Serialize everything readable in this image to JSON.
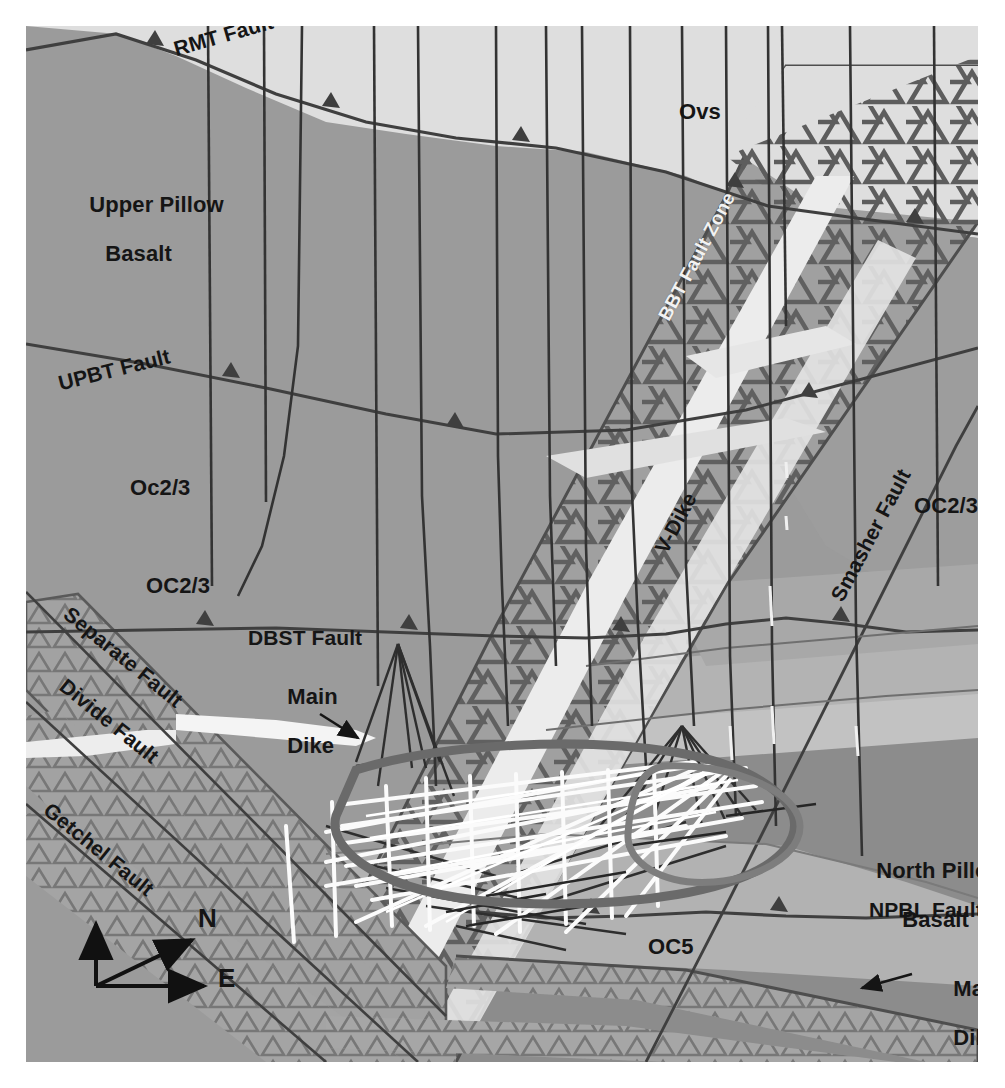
{
  "figure": {
    "type": "geologic-cross-section",
    "orientation_note": "Oblique 3-D block section viewed with N and E horizontal reference arrows",
    "background_color": "#ffffff",
    "frame_color": "#9b9b9b"
  },
  "palette": {
    "upper_pillow_basalt": "#9b9b9b",
    "ovs_light": "#dedede",
    "oc23_mid": "#9b9b9b",
    "oc23_right": "#989898",
    "npbl_dark": "#8a8a8a",
    "band_light": "#bcbcbc",
    "band_pale": "#c9c9c9",
    "oc5_pale": "#b4b4b4",
    "dike_fill": "#a3a3a3",
    "hatch_line": "#5d5d5d",
    "fault_line": "#4a4a4a",
    "drillhole": "#3a3a3a",
    "white_dike": "#f4f4f4",
    "workings_white": "#fbfbfb",
    "text_black": "#151515",
    "text_white": "#f2f2f2"
  },
  "units": [
    {
      "id": "upper-pillow-basalt",
      "label": "Upper Pillow\nBasalt",
      "line1": "Upper Pillow",
      "line2": "Basalt"
    },
    {
      "id": "ovs",
      "label": "Ovs"
    },
    {
      "id": "oc23-upper",
      "label": "Oc2/3"
    },
    {
      "id": "oc23-lower-left",
      "label": "OC2/3"
    },
    {
      "id": "oc23-right",
      "label": "OC2/3"
    },
    {
      "id": "north-pillow-basalt",
      "label": "North Pillow\nBasalt",
      "line1": "North Pillow",
      "line2": "Basalt"
    },
    {
      "id": "oc5",
      "label": "OC5"
    }
  ],
  "faults": [
    {
      "id": "rmt-fault",
      "label": "RMT Fault",
      "rotation_deg": -16,
      "style": "black"
    },
    {
      "id": "upbt-fault",
      "label": "UPBT Fault",
      "rotation_deg": -14,
      "style": "black"
    },
    {
      "id": "dbst-fault",
      "label": "DBST Fault",
      "rotation_deg": 0,
      "style": "black"
    },
    {
      "id": "separate-fault",
      "label": "Separate Fault",
      "rotation_deg": 39,
      "style": "black"
    },
    {
      "id": "divide-fault",
      "label": "Divide Fault",
      "rotation_deg": 39,
      "style": "black"
    },
    {
      "id": "getchel-fault",
      "label": "Getchel Fault",
      "rotation_deg": 39,
      "style": "black"
    },
    {
      "id": "bbt-fault-zone",
      "label": "BBT Fault Zone",
      "rotation_deg": 62,
      "style": "white"
    },
    {
      "id": "smasher-fault",
      "label": "Smasher Fault",
      "rotation_deg": 62,
      "style": "black"
    },
    {
      "id": "npbl-fault",
      "label": "NPBL Fault",
      "rotation_deg": 0,
      "style": "black"
    }
  ],
  "dikes": [
    {
      "id": "v-dike",
      "label": "V-Dike",
      "rotation_deg": 62,
      "style": "black"
    },
    {
      "id": "main-dike-left",
      "label": "Main\nDike",
      "line1": "Main",
      "line2": "Dike",
      "annotation": "leader-arrow"
    },
    {
      "id": "main-dike-right",
      "label": "Main\nDike",
      "line1": "Main",
      "line2": "Dike",
      "annotation": "leader-arrow"
    }
  ],
  "compass": {
    "id": "compass-rose",
    "north_label": "N",
    "east_label": "E",
    "has_vertical_axis": true
  },
  "features": {
    "drillholes_count": 14,
    "mine_workings_note": "Dense white fan of underground workings / drill traces in central lower area",
    "hatch_pattern": "open triangles (dike swarm ornament)",
    "fault_teeth": "small triangular tick marks on thrust traces"
  }
}
